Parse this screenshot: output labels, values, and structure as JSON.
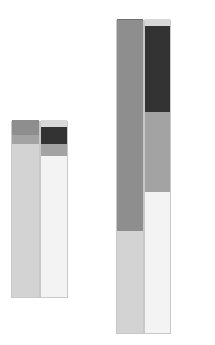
{
  "chart_data": {
    "type": "bar",
    "stacked": true,
    "title": "",
    "xlabel": "",
    "ylabel": "",
    "grid": false,
    "legend": null,
    "categories": [
      "Group 1",
      "Group 2"
    ],
    "groups": [
      {
        "name": "Group 1",
        "bars": [
          {
            "x": 11,
            "width": 29,
            "segments": [
              {
                "value": 153,
                "color": "#d3d3d3"
              },
              {
                "value": 9,
                "color": "#a3a3a3"
              },
              {
                "value": 15,
                "color": "#8e8e8e"
              }
            ]
          },
          {
            "x": 40,
            "width": 28,
            "segments": [
              {
                "value": 141,
                "color": "#f3f3f3"
              },
              {
                "value": 12,
                "color": "#a3a3a3"
              },
              {
                "value": 17,
                "color": "#333333"
              },
              {
                "value": 7,
                "color": "#d8d8d8"
              }
            ]
          }
        ],
        "bottom": 298
      },
      {
        "name": "Group 2",
        "bars": [
          {
            "x": 116,
            "width": 28,
            "segments": [
              {
                "value": 102,
                "color": "#d3d3d3"
              },
              {
                "value": 68,
                "color": "#8e8e8e"
              },
              {
                "value": 144,
                "color": "#8e8e8e"
              }
            ]
          },
          {
            "x": 144,
            "width": 27,
            "segments": [
              {
                "value": 141,
                "color": "#f3f3f3"
              },
              {
                "value": 80,
                "color": "#a3a3a3"
              },
              {
                "value": 86,
                "color": "#333333"
              },
              {
                "value": 7,
                "color": "#d8d8d8"
              }
            ]
          }
        ],
        "bottom": 334
      }
    ]
  }
}
